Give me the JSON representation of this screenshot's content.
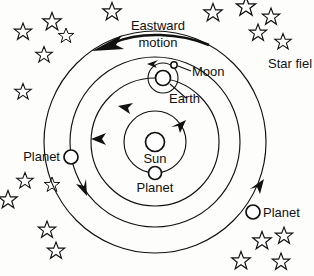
{
  "diagram": {
    "title_visible": false,
    "background_color": "#fdfdfb",
    "ink_color": "#111111",
    "labels": {
      "eastward": "Eastward",
      "motion": "motion",
      "star_field": "Star fiel",
      "moon": "Moon",
      "earth": "Earth",
      "sun": "Sun",
      "planet_inner": "Planet",
      "planet_left": "Planet",
      "planet_right": "Planet"
    },
    "bodies": [
      {
        "name": "sun",
        "label": "Sun",
        "cx": 155,
        "cy": 142,
        "r": 9.5
      },
      {
        "name": "planet-inner",
        "label": "Planet",
        "cx": 155,
        "cy": 173,
        "r": 6.5
      },
      {
        "name": "earth",
        "label": "Earth",
        "cx": 163,
        "cy": 78,
        "r": 7.5
      },
      {
        "name": "moon",
        "label": "Moon",
        "cx": 174,
        "cy": 65,
        "r": 3.2
      },
      {
        "name": "planet-left",
        "label": "Planet",
        "cx": 71,
        "cy": 157,
        "r": 7.0
      },
      {
        "name": "planet-right",
        "label": "Planet",
        "cx": 253,
        "cy": 212,
        "r": 7.0
      }
    ],
    "orbits": [
      {
        "name": "orbit-inner-planet",
        "cx": 155,
        "cy": 142,
        "r": 31
      },
      {
        "name": "orbit-earth",
        "cx": 155,
        "cy": 142,
        "r": 64
      },
      {
        "name": "orbit-planet-left",
        "cx": 155,
        "cy": 142,
        "r": 85
      },
      {
        "name": "orbit-planet-right",
        "cx": 155,
        "cy": 142,
        "r": 111
      },
      {
        "name": "moon-orbit",
        "cx": 163,
        "cy": 78,
        "r": 15
      }
    ],
    "direction_arrows": [
      {
        "name": "arrow-inner-planet-orbit",
        "at_deg": -35
      },
      {
        "name": "arrow-earth-orbit",
        "at_deg": 180
      },
      {
        "name": "arrow-moon-orbit",
        "at_deg": 115
      },
      {
        "name": "arrow-outer-left-orbit",
        "at_deg": 215
      },
      {
        "name": "arrow-outer-right-orbit",
        "at_deg": 40
      }
    ],
    "stars": [
      {
        "x": 23,
        "y": 32,
        "s": 9
      },
      {
        "x": 52,
        "y": 22,
        "s": 9.5
      },
      {
        "x": 66,
        "y": 36,
        "s": 8
      },
      {
        "x": 44,
        "y": 55,
        "s": 8.5
      },
      {
        "x": 23,
        "y": 92,
        "s": 8.5
      },
      {
        "x": 112,
        "y": 12,
        "s": 9.5
      },
      {
        "x": 213,
        "y": 13,
        "s": 9.5
      },
      {
        "x": 246,
        "y": 7,
        "s": 10
      },
      {
        "x": 271,
        "y": 17,
        "s": 9
      },
      {
        "x": 258,
        "y": 33,
        "s": 9
      },
      {
        "x": 283,
        "y": 42,
        "s": 8.5
      },
      {
        "x": 25,
        "y": 181,
        "s": 8.5
      },
      {
        "x": 8,
        "y": 200,
        "s": 9.5
      },
      {
        "x": 47,
        "y": 230,
        "s": 9
      },
      {
        "x": 56,
        "y": 251,
        "s": 9
      },
      {
        "x": 262,
        "y": 241,
        "s": 9.5
      },
      {
        "x": 284,
        "y": 236,
        "s": 9
      },
      {
        "x": 241,
        "y": 261,
        "s": 9.5
      },
      {
        "x": 281,
        "y": 262,
        "s": 9
      },
      {
        "x": 52,
        "y": 185,
        "s": 8
      }
    ]
  }
}
